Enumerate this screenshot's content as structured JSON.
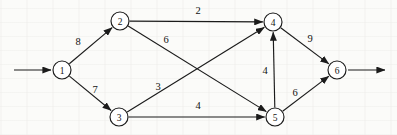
{
  "diagram": {
    "type": "directed-graph",
    "width": 397,
    "height": 135,
    "node_radius": 9,
    "stroke_color": "#1b1b1b",
    "background_color": "#fbfbf9",
    "nodes": [
      {
        "id": "1",
        "label": "1",
        "x": 62,
        "y": 70,
        "name": "node-1"
      },
      {
        "id": "2",
        "label": "2",
        "x": 120,
        "y": 21,
        "name": "node-2"
      },
      {
        "id": "3",
        "label": "3",
        "x": 119,
        "y": 117,
        "name": "node-3"
      },
      {
        "id": "4",
        "label": "4",
        "x": 273,
        "y": 22,
        "name": "node-4"
      },
      {
        "id": "5",
        "label": "5",
        "x": 275,
        "y": 117,
        "name": "node-5"
      },
      {
        "id": "6",
        "label": "6",
        "x": 337,
        "y": 70,
        "name": "node-6"
      }
    ],
    "edges": [
      {
        "from": "1",
        "to": "2",
        "weight": "8",
        "label_x": 78,
        "label_y": 41,
        "name": "edge-1-2"
      },
      {
        "from": "1",
        "to": "3",
        "weight": "7",
        "label_x": 95,
        "label_y": 89,
        "name": "edge-1-3"
      },
      {
        "from": "2",
        "to": "4",
        "weight": "2",
        "label_x": 198,
        "label_y": 10,
        "name": "edge-2-4"
      },
      {
        "from": "2",
        "to": "5",
        "weight": "6",
        "label_x": 166,
        "label_y": 39,
        "name": "edge-2-5"
      },
      {
        "from": "3",
        "to": "4",
        "weight": "3",
        "label_x": 158,
        "label_y": 86,
        "name": "edge-3-4"
      },
      {
        "from": "3",
        "to": "5",
        "weight": "4",
        "label_x": 198,
        "label_y": 105,
        "name": "edge-3-5"
      },
      {
        "from": "5",
        "to": "4",
        "weight": "4",
        "label_x": 265,
        "label_y": 70,
        "name": "edge-5-4"
      },
      {
        "from": "4",
        "to": "6",
        "weight": "9",
        "label_x": 310,
        "label_y": 38,
        "name": "edge-4-6"
      },
      {
        "from": "5",
        "to": "6",
        "weight": "6",
        "label_x": 295,
        "label_y": 92,
        "name": "edge-5-6"
      }
    ],
    "terminals": {
      "source_arrow": {
        "x1": 14,
        "y1": 70,
        "x2": 51,
        "y2": 70,
        "name": "source-inflow-arrow"
      },
      "sink_arrow": {
        "x1": 348,
        "y1": 70,
        "x2": 385,
        "y2": 70,
        "name": "sink-outflow-arrow"
      }
    }
  }
}
